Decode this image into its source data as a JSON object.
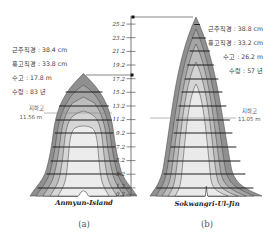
{
  "figure": {
    "type": "stem-profile-diagram",
    "background": "#ffffff",
    "ink_color": "#3a3a3a"
  },
  "axis_ticks": [
    "25.2",
    "23.2",
    "21.2",
    "19.2",
    "17.2",
    "15.2",
    "13.2",
    "11.2",
    "9.2",
    "7.2",
    "5.2",
    "3.2",
    "1.2",
    "0.2"
  ],
  "trees": [
    {
      "name": "Anmyun-Island",
      "caption": "(a)",
      "info_lines": [
        "근주직경 : 38.4 cm",
        "흉고직경 : 33.8 cm",
        "수고 : 17.8 m",
        "수령 : 83 년"
      ],
      "crown_base_label": "지하고",
      "crown_base_value": "11.56 m"
    },
    {
      "name": "Sokwangri-Ul-Jin",
      "caption": "(b)",
      "info_lines": [
        "근주직경 : 38.8 cm",
        "흉고직경 : 33.2 cm",
        "수고 : 26.2 m",
        "수령 : 57 년"
      ],
      "crown_base_label": "지하고",
      "crown_base_value": "11.05 m"
    }
  ]
}
